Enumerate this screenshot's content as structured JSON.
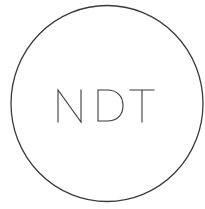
{
  "logo": {
    "text": "NDT",
    "stroke_color": "#3a3a3a",
    "background_color": "#ffffff"
  }
}
